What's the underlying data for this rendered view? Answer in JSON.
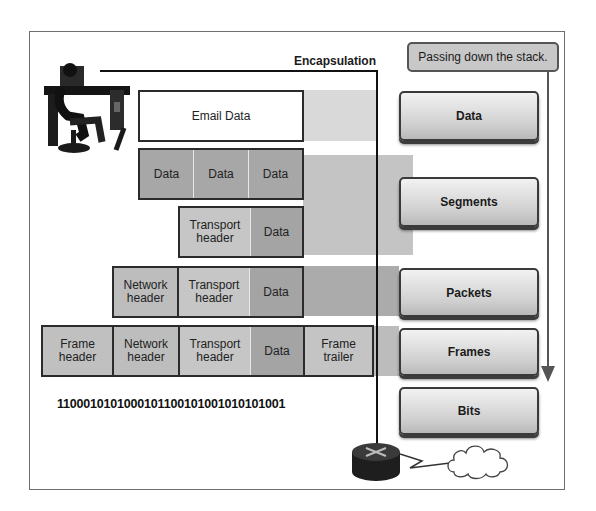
{
  "title": "Encapsulation",
  "note": "Passing down the stack.",
  "colors": {
    "light_band": "#d6d6d6",
    "mid_band": "#bdbdbd",
    "dark_band": "#a9a9a9",
    "data_cell": "#a4a4a4",
    "header_cell": "#c7c7c7",
    "border": "#2b2b2b"
  },
  "rows": {
    "application": {
      "cells": [
        "Email Data"
      ]
    },
    "segmented": {
      "cells": [
        "Data",
        "Data",
        "Data"
      ]
    },
    "segment": {
      "cells": [
        "Transport header",
        "Data"
      ]
    },
    "packet": {
      "cells": [
        "Network header",
        "Transport header",
        "Data"
      ]
    },
    "frame": {
      "cells": [
        "Frame header",
        "Network header",
        "Transport header",
        "Data",
        "Frame trailer"
      ]
    }
  },
  "bits": "1100010101000101100101001010101001",
  "layers": [
    "Data",
    "Segments",
    "Packets",
    "Frames",
    "Bits"
  ],
  "icons": [
    "user-at-computer-icon",
    "router-icon",
    "cloud-icon",
    "down-arrow-icon"
  ]
}
